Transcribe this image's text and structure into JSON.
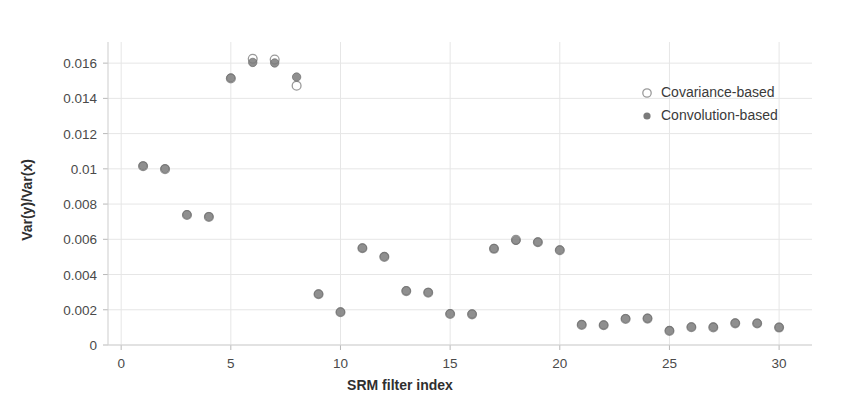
{
  "chart_data": {
    "type": "scatter",
    "title": "",
    "xlabel": "SRM filter index",
    "ylabel": "Var(y)/Var(x)",
    "xlim": [
      -0.6,
      31.5
    ],
    "ylim": [
      0,
      0.0172
    ],
    "grid": true,
    "legend_position": "upper-right-inside",
    "xticks": [
      0,
      5,
      10,
      15,
      20,
      25,
      30
    ],
    "xtick_labels": [
      "0",
      "5",
      "10",
      "15",
      "20",
      "25",
      "30"
    ],
    "yticks": [
      0,
      0.002,
      0.004,
      0.006,
      0.008,
      0.01,
      0.012,
      0.014,
      0.016
    ],
    "ytick_labels": [
      "0",
      "0.002",
      "0.004",
      "0.006",
      "0.008",
      "0.01",
      "0.012",
      "0.014",
      "0.016"
    ],
    "x": [
      1,
      2,
      3,
      4,
      5,
      6,
      7,
      8,
      9,
      10,
      11,
      12,
      13,
      14,
      15,
      16,
      17,
      18,
      19,
      20,
      21,
      22,
      23,
      24,
      25,
      26,
      27,
      28,
      29,
      30
    ],
    "series": [
      {
        "name": "Covariance-based",
        "marker": "open-circle",
        "color": "#9a9a9a",
        "values": [
          0.01015,
          0.00998,
          0.00738,
          0.00727,
          0.01513,
          0.01625,
          0.0162,
          0.01472,
          0.00288,
          0.00186,
          0.00549,
          0.005,
          0.00306,
          0.00297,
          0.00176,
          0.00174,
          0.00546,
          0.00597,
          0.00583,
          0.00538,
          0.00114,
          0.00112,
          0.00148,
          0.0015,
          0.0008,
          0.00101,
          0.001,
          0.00123,
          0.00122,
          0.00099
        ]
      },
      {
        "name": "Convolution-based",
        "marker": "filled-circle",
        "color": "#7b7b7b",
        "values": [
          0.01017,
          0.01001,
          0.0074,
          0.00729,
          0.01516,
          0.01604,
          0.01601,
          0.01521,
          0.0029,
          0.00188,
          0.00551,
          0.00502,
          0.00308,
          0.00299,
          0.00178,
          0.00176,
          0.00548,
          0.00594,
          0.00585,
          0.0054,
          0.00116,
          0.00114,
          0.0015,
          0.00152,
          0.00082,
          0.00103,
          0.00102,
          0.00125,
          0.00124,
          0.00101
        ]
      }
    ],
    "legend": [
      {
        "label": "Covariance-based",
        "marker": "open-circle"
      },
      {
        "label": "Convolution-based",
        "marker": "filled-circle"
      }
    ]
  }
}
